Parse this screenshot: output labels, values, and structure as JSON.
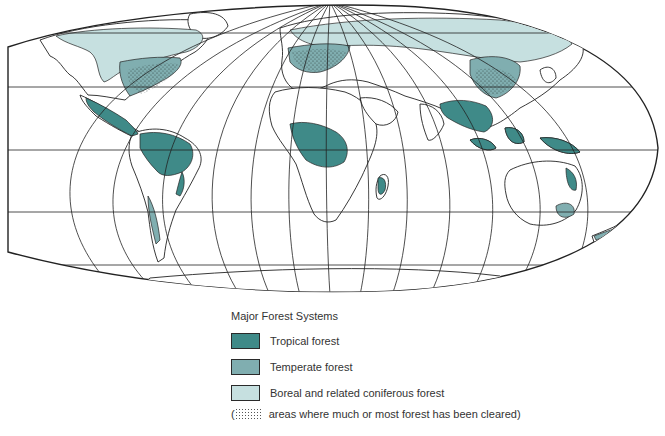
{
  "map": {
    "title": "World map of major forest systems",
    "projection": "pseudo-elliptical (Robinson-like) with graticule",
    "colors": {
      "tropical": "#3f8a88",
      "temperate": "#80aeb0",
      "boreal": "#c6e0e0",
      "outline": "#222222",
      "land": "#ffffff"
    },
    "regions": [
      {
        "name": "North America",
        "forest_types": [
          "boreal",
          "temperate"
        ]
      },
      {
        "name": "Central America",
        "forest_types": [
          "tropical"
        ]
      },
      {
        "name": "South America",
        "forest_types": [
          "tropical",
          "temperate"
        ]
      },
      {
        "name": "Europe",
        "forest_types": [
          "temperate",
          "boreal"
        ]
      },
      {
        "name": "Northern Asia",
        "forest_types": [
          "boreal"
        ]
      },
      {
        "name": "East Asia",
        "forest_types": [
          "temperate"
        ]
      },
      {
        "name": "Southeast Asia",
        "forest_types": [
          "tropical"
        ]
      },
      {
        "name": "Central Africa",
        "forest_types": [
          "tropical"
        ]
      },
      {
        "name": "Madagascar",
        "forest_types": [
          "tropical"
        ]
      },
      {
        "name": "Australia",
        "forest_types": [
          "tropical",
          "temperate"
        ]
      },
      {
        "name": "New Zealand",
        "forest_types": [
          "temperate"
        ]
      }
    ]
  },
  "legend": {
    "title": "Major Forest Systems",
    "items": [
      {
        "label": "Tropical forest",
        "color": "#3f8a88"
      },
      {
        "label": "Temperate forest",
        "color": "#80aeb0"
      },
      {
        "label": "Boreal and related coniferous forest",
        "color": "#c6e0e0"
      }
    ],
    "note_prefix": "(",
    "note": "areas where much or most forest has been cleared)"
  }
}
